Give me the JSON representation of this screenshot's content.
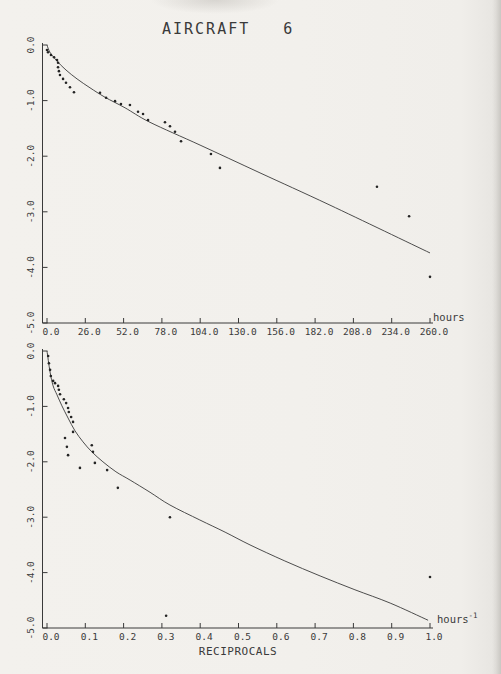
{
  "page": {
    "title": "AIRCRAFT   6"
  },
  "colors": {
    "ink": "#3a3a3a",
    "paper": "#f1efeb",
    "point": "#242424"
  },
  "chart_data": [
    {
      "name": "hours",
      "type": "scatter",
      "title": "AIRCRAFT 6",
      "xlabel": "",
      "x_unit": "hours",
      "x_unit_sup": "",
      "ylabel": "",
      "xlim": [
        0,
        260
      ],
      "ylim": [
        -5,
        0
      ],
      "grid": false,
      "x_ticks": [
        "0.0",
        "26.0",
        "52.0",
        "78.0",
        "104.0",
        "130.0",
        "156.0",
        "182.0",
        "208.0",
        "234.0",
        "260.0"
      ],
      "y_ticks": [
        "0.0",
        "-1.0",
        "-2.0",
        "-3.0",
        "-4.0",
        "-5.0"
      ],
      "points": [
        [
          0,
          -0.09
        ],
        [
          0.7,
          -0.13
        ],
        [
          2.7,
          -0.18
        ],
        [
          4.8,
          -0.22
        ],
        [
          6.8,
          -0.27
        ],
        [
          7.5,
          -0.32
        ],
        [
          7.5,
          -0.4
        ],
        [
          8.1,
          -0.47
        ],
        [
          8.8,
          -0.54
        ],
        [
          10.9,
          -0.61
        ],
        [
          12.9,
          -0.68
        ],
        [
          15.6,
          -0.76
        ],
        [
          18.3,
          -0.85
        ],
        [
          36,
          -0.86
        ],
        [
          40.1,
          -0.95
        ],
        [
          46.2,
          -1.01
        ],
        [
          50.2,
          -1.06
        ],
        [
          56.3,
          -1.08
        ],
        [
          61.8,
          -1.2
        ],
        [
          65.2,
          -1.24
        ],
        [
          68.6,
          -1.35
        ],
        [
          80.1,
          -1.39
        ],
        [
          83.5,
          -1.46
        ],
        [
          86.9,
          -1.56
        ],
        [
          91,
          -1.73
        ],
        [
          111.3,
          -1.96
        ],
        [
          117.4,
          -2.21
        ],
        [
          224,
          -2.55
        ],
        [
          245.8,
          -3.08
        ],
        [
          260,
          -4.17
        ]
      ],
      "fit_curve": [
        [
          0,
          0
        ],
        [
          2,
          -0.13
        ],
        [
          6.8,
          -0.29
        ],
        [
          12.9,
          -0.45
        ],
        [
          20.4,
          -0.61
        ],
        [
          29.2,
          -0.77
        ],
        [
          39.4,
          -0.94
        ],
        [
          53,
          -1.13
        ],
        [
          69.9,
          -1.39
        ],
        [
          103.9,
          -1.8
        ],
        [
          144.6,
          -2.3
        ],
        [
          192.1,
          -2.88
        ],
        [
          260,
          -3.74
        ]
      ]
    },
    {
      "name": "reciprocals",
      "type": "scatter",
      "title": "",
      "xlabel": "RECIPROCALS",
      "x_unit": "hours",
      "x_unit_sup": "-1",
      "ylabel": "",
      "xlim": [
        0,
        1
      ],
      "ylim": [
        -5,
        0
      ],
      "grid": false,
      "x_ticks": [
        "0.0",
        "0.1",
        "0.2",
        "0.3",
        "0.4",
        "0.5",
        "0.6",
        "0.7",
        "0.8",
        "0.9",
        "1.0"
      ],
      "y_ticks": [
        "0.0",
        "-1.0",
        "-2.0",
        "-3.0",
        "-4.0",
        "-5.0"
      ],
      "points": [
        [
          0.003,
          -0.09
        ],
        [
          0.005,
          -0.22
        ],
        [
          0.008,
          -0.34
        ],
        [
          0.01,
          -0.45
        ],
        [
          0.016,
          -0.54
        ],
        [
          0.021,
          -0.58
        ],
        [
          0.029,
          -0.63
        ],
        [
          0.031,
          -0.7
        ],
        [
          0.034,
          -0.78
        ],
        [
          0.044,
          -0.87
        ],
        [
          0.05,
          -0.94
        ],
        [
          0.055,
          -1.03
        ],
        [
          0.057,
          -1.1
        ],
        [
          0.063,
          -1.19
        ],
        [
          0.068,
          -1.28
        ],
        [
          0.068,
          -1.46
        ],
        [
          0.047,
          -1.57
        ],
        [
          0.052,
          -1.73
        ],
        [
          0.055,
          -1.88
        ],
        [
          0.086,
          -2.11
        ],
        [
          0.117,
          -1.7
        ],
        [
          0.12,
          -1.82
        ],
        [
          0.125,
          -2.02
        ],
        [
          0.157,
          -2.15
        ],
        [
          0.185,
          -2.47
        ],
        [
          0.321,
          -3
        ],
        [
          0.311,
          -4.78
        ],
        [
          1,
          -4.08
        ]
      ],
      "fit_curve": [
        [
          0,
          0
        ],
        [
          0.008,
          -0.38
        ],
        [
          0.016,
          -0.63
        ],
        [
          0.026,
          -0.79
        ],
        [
          0.039,
          -0.99
        ],
        [
          0.055,
          -1.21
        ],
        [
          0.073,
          -1.44
        ],
        [
          0.094,
          -1.64
        ],
        [
          0.117,
          -1.82
        ],
        [
          0.146,
          -2
        ],
        [
          0.18,
          -2.18
        ],
        [
          0.217,
          -2.33
        ],
        [
          0.269,
          -2.55
        ],
        [
          0.321,
          -2.78
        ],
        [
          0.399,
          -3.05
        ],
        [
          0.465,
          -3.27
        ],
        [
          0.53,
          -3.5
        ],
        [
          0.621,
          -3.79
        ],
        [
          0.713,
          -4.06
        ],
        [
          0.804,
          -4.31
        ],
        [
          0.896,
          -4.55
        ],
        [
          0.995,
          -4.86
        ]
      ]
    }
  ]
}
